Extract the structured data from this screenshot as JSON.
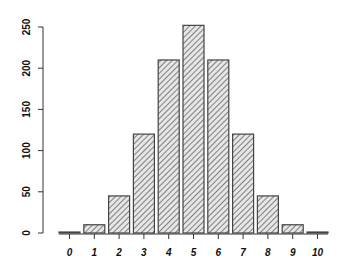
{
  "chart_data": {
    "type": "bar",
    "title": "",
    "xlabel": "",
    "ylabel": "",
    "categories": [
      "0",
      "1",
      "2",
      "3",
      "4",
      "5",
      "6",
      "7",
      "8",
      "9",
      "10"
    ],
    "values": [
      1,
      10,
      45,
      120,
      210,
      252,
      210,
      120,
      45,
      10,
      1
    ],
    "ylim": [
      0,
      250
    ],
    "yticks": [
      0,
      50,
      100,
      150,
      200,
      250
    ],
    "grid": false,
    "legend": null,
    "bar_fill": "diagonal-hatch",
    "colors": {
      "bar_stroke": "#444444",
      "hatch": "#666666",
      "axis": "#333333"
    }
  }
}
